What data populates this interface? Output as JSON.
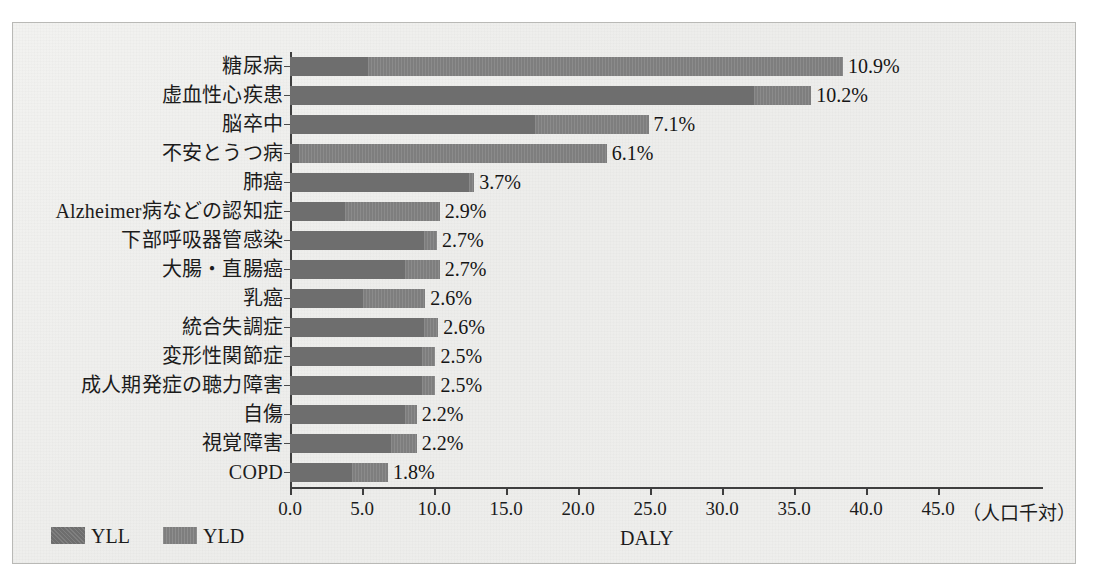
{
  "chart_data": {
    "type": "bar",
    "orientation": "horizontal",
    "stacked": true,
    "title": "",
    "xlabel": "DALY",
    "ylabel": "",
    "xunit": "（人口千対）",
    "xlim": [
      0.0,
      45.0
    ],
    "xticks": [
      "0.0",
      "5.0",
      "10.0",
      "15.0",
      "20.0",
      "25.0",
      "30.0",
      "35.0",
      "40.0",
      "45.0"
    ],
    "xtick_values": [
      0,
      5,
      10,
      15,
      20,
      25,
      30,
      35,
      40,
      45
    ],
    "grid": false,
    "legend_position": "bottom-left",
    "legend": [
      "YLL",
      "YLD"
    ],
    "series": [
      {
        "name": "YLL",
        "values": [
          5.4,
          32.2,
          17.0,
          0.6,
          12.4,
          3.8,
          9.3,
          8.0,
          5.1,
          9.3,
          9.2,
          9.2,
          8.0,
          7.0,
          4.3
        ]
      },
      {
        "name": "YLD",
        "values": [
          33.0,
          4.0,
          7.9,
          21.4,
          0.4,
          6.6,
          0.9,
          2.4,
          4.3,
          1.0,
          0.9,
          0.9,
          0.8,
          1.8,
          2.5
        ]
      }
    ],
    "categories": [
      "糖尿病",
      "虚血性心疾患",
      "脳卒中",
      "不安とうつ病",
      "肺癌",
      "Alzheimer病などの認知症",
      "下部呼吸器管感染",
      "大腸・直腸癌",
      "乳癌",
      "統合失調症",
      "変形性関節症",
      "成人期発症の聴力障害",
      "自傷",
      "視覚障害",
      "COPD"
    ],
    "totals": [
      38.4,
      36.2,
      24.9,
      22.0,
      12.8,
      10.4,
      10.2,
      10.4,
      9.4,
      10.3,
      10.1,
      10.1,
      8.8,
      8.8,
      6.8
    ],
    "data_labels": [
      "10.9%",
      "10.2%",
      "7.1%",
      "6.1%",
      "3.7%",
      "2.9%",
      "2.7%",
      "2.7%",
      "2.6%",
      "2.6%",
      "2.5%",
      "2.5%",
      "2.2%",
      "2.2%",
      "1.8%"
    ],
    "colors": {
      "yll": "#6e6e6e",
      "yld": "#7e7e7e",
      "axis": "#3f3f3f",
      "text": "#1c1c1c",
      "background": "#eeeeec"
    }
  }
}
